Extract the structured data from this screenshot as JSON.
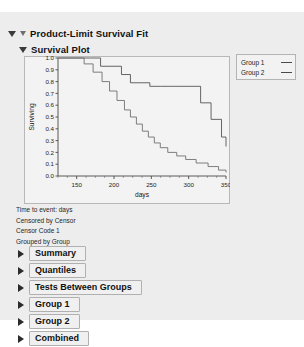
{
  "panel": {
    "title": "Product-Limit Survival Fit",
    "subsection_title": "Survival Plot"
  },
  "legend": {
    "items": [
      {
        "label": "Group 1",
        "color": "#4a4a4a"
      },
      {
        "label": "Group 2",
        "color": "#4a4a4a"
      }
    ]
  },
  "info_lines": [
    "Time to event: days",
    "Censored by Censor",
    "Censor Code 1",
    "Grouped by Group"
  ],
  "sections": [
    {
      "label": "Summary"
    },
    {
      "label": "Quantiles"
    },
    {
      "label": "Tests Between Groups"
    },
    {
      "label": "Group 1"
    },
    {
      "label": "Group 2"
    },
    {
      "label": "Combined"
    }
  ],
  "chart_data": {
    "type": "line",
    "title": "Survival Plot",
    "xlabel": "days",
    "ylabel": "Surviving",
    "xlim": [
      125,
      350
    ],
    "ylim": [
      0.0,
      1.0
    ],
    "xticks": [
      150,
      200,
      250,
      300,
      350
    ],
    "xtick_labels": [
      "150",
      "200",
      "250",
      "300",
      "350"
    ],
    "yticks": [
      0.0,
      0.1,
      0.2,
      0.3,
      0.4,
      0.5,
      0.6,
      0.7,
      0.8,
      0.9,
      1.0
    ],
    "ytick_labels": [
      "0.0",
      "0.1",
      "0.2",
      "0.3",
      "0.4",
      "0.5",
      "0.6",
      "0.7",
      "0.8",
      "0.9",
      "1.0"
    ],
    "grid": false,
    "legend_position": "outside-right-top",
    "step_type": "post",
    "series": [
      {
        "name": "Group 1",
        "color": "#555555",
        "x": [
          125,
          168,
          182,
          196,
          210,
          222,
          236,
          248,
          262,
          276,
          290,
          302,
          316,
          330,
          344,
          350
        ],
        "y": [
          1.0,
          1.0,
          0.93,
          0.93,
          0.86,
          0.79,
          0.79,
          0.76,
          0.76,
          0.76,
          0.76,
          0.76,
          0.62,
          0.48,
          0.33,
          0.25
        ]
      },
      {
        "name": "Group 2",
        "color": "#707070",
        "x": [
          125,
          160,
          172,
          184,
          194,
          204,
          214,
          222,
          230,
          238,
          246,
          254,
          262,
          272,
          284,
          296,
          310,
          326,
          340,
          350
        ],
        "y": [
          1.0,
          0.95,
          0.88,
          0.8,
          0.72,
          0.64,
          0.56,
          0.5,
          0.44,
          0.38,
          0.33,
          0.28,
          0.24,
          0.2,
          0.17,
          0.14,
          0.11,
          0.08,
          0.05,
          0.03
        ]
      }
    ]
  }
}
